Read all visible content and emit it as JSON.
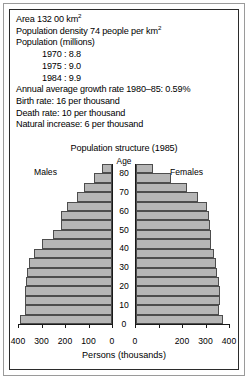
{
  "panel": {
    "stats": [
      {
        "text": "Area 132 00 km",
        "sup": "2",
        "indent": false
      },
      {
        "text": "Population density 74 people per km",
        "sup": "2",
        "indent": false
      },
      {
        "text": "Population (millions)",
        "sup": "",
        "indent": false
      },
      {
        "text": "1970 : 8.8",
        "sup": "",
        "indent": true
      },
      {
        "text": "1975 : 9.0",
        "sup": "",
        "indent": true
      },
      {
        "text": "1984 : 9.9",
        "sup": "",
        "indent": true
      },
      {
        "text": "Annual average growth rate 1980–85: 0.59%",
        "sup": "",
        "indent": false
      },
      {
        "text": "Birth rate: 16 per thousand",
        "sup": "",
        "indent": false
      },
      {
        "text": "Death rate: 10 per thousand",
        "sup": "",
        "indent": false
      },
      {
        "text": "Natural increase: 6 per thousand",
        "sup": "",
        "indent": false
      }
    ]
  },
  "colors": {
    "bar_fill": "#b6b6b6",
    "bar_stroke": "#4d4d4d",
    "axis": "#1a1a1a",
    "frame_outer": "#9a9a9a",
    "frame_inner": "#2b2b2b",
    "background": "#ffffff"
  },
  "chart_data": {
    "type": "bar",
    "subtype": "population-pyramid",
    "title": "Population structure (1985)",
    "age_axis_label": "Age",
    "xlabel": "Persons (thousands)",
    "ylabel": "Age",
    "left_series_label": "Males",
    "right_series_label": "Females",
    "grid": false,
    "legend": "inline-labels",
    "xlim": [
      0,
      400
    ],
    "ylim": [
      0,
      85
    ],
    "age_ticks": [
      0,
      10,
      20,
      30,
      40,
      50,
      60,
      70,
      80
    ],
    "x_ticks": [
      0,
      100,
      200,
      300,
      400
    ],
    "left_tick_labels": [
      "400",
      "300",
      "200",
      "100",
      "0"
    ],
    "right_tick_labels": [
      "0",
      "",
      "200",
      "300",
      "400"
    ],
    "categories": [
      "0-4",
      "5-9",
      "10-14",
      "15-19",
      "20-24",
      "25-29",
      "30-34",
      "35-39",
      "40-44",
      "45-49",
      "50-54",
      "55-59",
      "60-64",
      "65-69",
      "70-74",
      "75-79",
      "80+"
    ],
    "series": [
      {
        "name": "Males",
        "side": "left",
        "values": [
          390,
          370,
          372,
          372,
          368,
          360,
          352,
          330,
          300,
          250,
          218,
          215,
          190,
          150,
          120,
          78,
          42
        ]
      },
      {
        "name": "Females",
        "side": "right",
        "values": [
          372,
          355,
          358,
          358,
          352,
          345,
          340,
          330,
          320,
          318,
          315,
          312,
          300,
          262,
          215,
          148,
          72
        ]
      }
    ]
  }
}
